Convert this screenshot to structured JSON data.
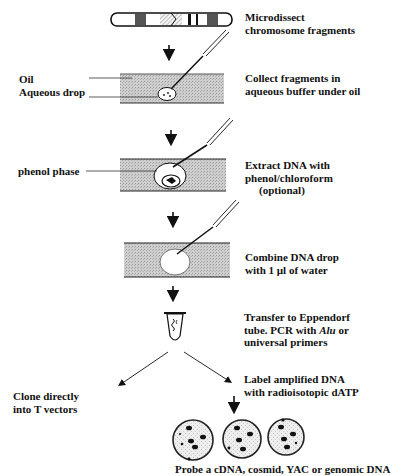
{
  "diagram": {
    "type": "flowchart",
    "steps": [
      {
        "id": "microdissect",
        "line1": "Microdissect",
        "line2": "chromosome fragments"
      },
      {
        "id": "collect",
        "line1": "Collect fragments in",
        "line2": "aqueous buffer under oil"
      },
      {
        "id": "extract",
        "line1": "Extract DNA with",
        "line2": "phenol/chloroform",
        "line3": "(optional)"
      },
      {
        "id": "combine",
        "line1": "Combine DNA drop",
        "line2": "with 1 µl of water"
      },
      {
        "id": "transfer",
        "line1": "Transfer to Eppendorf",
        "line2a": "tube. PCR with ",
        "line2b": "Alu",
        "line2c": " or",
        "line3": "universal primers"
      },
      {
        "id": "clone",
        "line1": "Clone directly",
        "line2": "into T vectors"
      },
      {
        "id": "label",
        "line1": "Label amplified DNA",
        "line2": "with radioisotopic dATP"
      },
      {
        "id": "probe",
        "line1": "Probe a cDNA, cosmid, YAC or genomic DNA"
      }
    ],
    "side_labels": {
      "oil": "Oil",
      "aqueous_drop": "Aqueous drop",
      "phenol_phase": "phenol phase"
    },
    "icons": [
      "chromosome-icon",
      "oil-layer-icon",
      "pipette-icon",
      "eppendorf-tube-icon",
      "petri-plate-icon",
      "arrow-down-icon"
    ]
  }
}
